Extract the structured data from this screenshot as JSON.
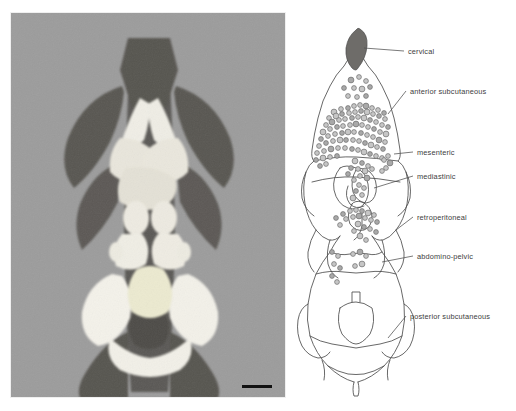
{
  "figure": {
    "panels": [
      {
        "id": "photograph",
        "kind": "specimen-photograph"
      },
      {
        "id": "schematic",
        "kind": "line-drawing-diagram"
      }
    ]
  },
  "photo": {
    "background_tone": "#9c9c9c",
    "skin_flap_tone": "#5c5a57",
    "fat_tissue_tone": "#f2f0e9",
    "scale_bar": {
      "present": true,
      "label": ""
    }
  },
  "diagram": {
    "outline_color": "#4a4a4a",
    "marker_fill": "#b9b9b9",
    "marker_stroke": "#6d6d6d",
    "cervical_depot_fill": "#6e6c69",
    "labels": [
      {
        "id": "cervical",
        "text": "cervical",
        "x": 112,
        "y": 46
      },
      {
        "id": "anterior-subcutaneous",
        "text": "anterior subcutaneous",
        "x": 114,
        "y": 86
      },
      {
        "id": "mesenteric",
        "text": "mesenteric",
        "x": 121,
        "y": 147
      },
      {
        "id": "mediastinic",
        "text": "mediastinic",
        "x": 121,
        "y": 171
      },
      {
        "id": "retroperitoneal",
        "text": "retroperitoneal",
        "x": 121,
        "y": 212
      },
      {
        "id": "abdomino-pelvic",
        "text": "abdomino-pelvic",
        "x": 121,
        "y": 251
      },
      {
        "id": "posterior-subcutaneous",
        "text": "posterior subcutaneous",
        "x": 114,
        "y": 311
      }
    ]
  },
  "chart_data": {
    "type": "scatter",
    "title": "",
    "xlabel": "",
    "ylabel": "",
    "categories": [
      "cervical",
      "anterior subcutaneous",
      "mesenteric",
      "mediastinic",
      "retroperitoneal",
      "abdomino-pelvic",
      "posterior subcutaneous"
    ],
    "series": [
      {
        "name": "marker count per depot",
        "values": [
          1,
          96,
          14,
          9,
          21,
          11,
          0
        ]
      }
    ],
    "markers": [
      [
        55,
        72
      ],
      [
        63,
        69
      ],
      [
        70,
        73
      ],
      [
        48,
        80
      ],
      [
        58,
        80
      ],
      [
        66,
        81
      ],
      [
        74,
        79
      ],
      [
        52,
        88
      ],
      [
        61,
        89
      ],
      [
        70,
        88
      ],
      [
        38,
        104
      ],
      [
        45,
        101
      ],
      [
        52,
        100
      ],
      [
        58,
        98
      ],
      [
        64,
        97
      ],
      [
        70,
        98
      ],
      [
        76,
        100
      ],
      [
        82,
        102
      ],
      [
        88,
        105
      ],
      [
        33,
        110
      ],
      [
        40,
        108
      ],
      [
        46,
        106
      ],
      [
        53,
        105
      ],
      [
        59,
        104
      ],
      [
        65,
        103
      ],
      [
        71,
        104
      ],
      [
        77,
        106
      ],
      [
        83,
        108
      ],
      [
        89,
        111
      ],
      [
        30,
        117
      ],
      [
        36,
        114
      ],
      [
        43,
        112
      ],
      [
        49,
        111
      ],
      [
        56,
        110
      ],
      [
        62,
        109
      ],
      [
        68,
        110
      ],
      [
        74,
        112
      ],
      [
        80,
        114
      ],
      [
        86,
        117
      ],
      [
        92,
        119
      ],
      [
        27,
        124
      ],
      [
        34,
        121
      ],
      [
        41,
        119
      ],
      [
        47,
        118
      ],
      [
        54,
        117
      ],
      [
        60,
        116
      ],
      [
        66,
        117
      ],
      [
        72,
        119
      ],
      [
        78,
        121
      ],
      [
        84,
        124
      ],
      [
        90,
        126
      ],
      [
        25,
        131
      ],
      [
        32,
        128
      ],
      [
        39,
        126
      ],
      [
        46,
        125
      ],
      [
        52,
        124
      ],
      [
        58,
        124
      ],
      [
        65,
        125
      ],
      [
        71,
        127
      ],
      [
        77,
        129
      ],
      [
        83,
        132
      ],
      [
        89,
        134
      ],
      [
        23,
        138
      ],
      [
        30,
        135
      ],
      [
        37,
        133
      ],
      [
        44,
        132
      ],
      [
        50,
        132
      ],
      [
        57,
        132
      ],
      [
        63,
        133
      ],
      [
        69,
        135
      ],
      [
        75,
        137
      ],
      [
        81,
        139
      ],
      [
        87,
        141
      ],
      [
        21,
        145
      ],
      [
        28,
        143
      ],
      [
        35,
        141
      ],
      [
        42,
        140
      ],
      [
        49,
        140
      ],
      [
        56,
        141
      ],
      [
        62,
        142
      ],
      [
        68,
        144
      ],
      [
        74,
        146
      ],
      [
        80,
        148
      ],
      [
        86,
        150
      ],
      [
        20,
        152
      ],
      [
        27,
        150
      ],
      [
        34,
        149
      ],
      [
        41,
        148
      ],
      [
        88,
        152
      ],
      [
        92,
        148
      ],
      [
        94,
        155
      ],
      [
        90,
        160
      ],
      [
        86,
        163
      ],
      [
        24,
        158
      ],
      [
        30,
        156
      ],
      [
        59,
        153
      ],
      [
        66,
        155
      ],
      [
        72,
        158
      ],
      [
        62,
        161
      ],
      [
        55,
        160
      ],
      [
        69,
        163
      ],
      [
        76,
        161
      ],
      [
        52,
        166
      ],
      [
        64,
        168
      ],
      [
        58,
        172
      ],
      [
        71,
        170
      ],
      [
        63,
        177
      ],
      [
        68,
        180
      ],
      [
        60,
        183
      ],
      [
        66,
        187
      ],
      [
        57,
        190
      ],
      [
        47,
        206
      ],
      [
        54,
        203
      ],
      [
        60,
        202
      ],
      [
        66,
        203
      ],
      [
        72,
        205
      ],
      [
        78,
        207
      ],
      [
        40,
        210
      ],
      [
        50,
        211
      ],
      [
        57,
        209
      ],
      [
        63,
        208
      ],
      [
        69,
        210
      ],
      [
        75,
        212
      ],
      [
        81,
        214
      ],
      [
        44,
        217
      ],
      [
        62,
        216
      ],
      [
        68,
        219
      ],
      [
        74,
        221
      ],
      [
        58,
        223
      ],
      [
        80,
        224
      ],
      [
        64,
        228
      ],
      [
        70,
        232
      ],
      [
        36,
        244
      ],
      [
        42,
        248
      ],
      [
        57,
        246
      ],
      [
        64,
        244
      ],
      [
        70,
        248
      ],
      [
        38,
        256
      ],
      [
        44,
        260
      ],
      [
        59,
        258
      ],
      [
        66,
        256
      ],
      [
        36,
        268
      ],
      [
        41,
        274
      ]
    ]
  }
}
